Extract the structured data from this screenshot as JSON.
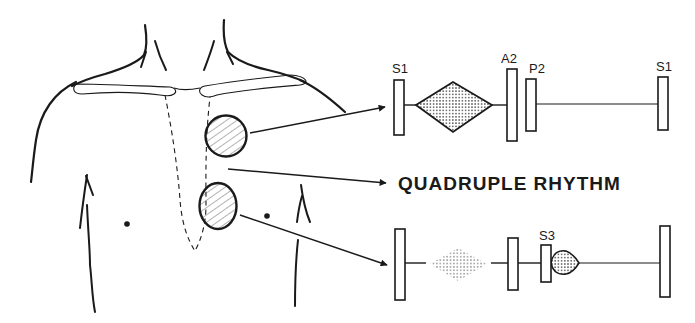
{
  "diagram": {
    "title": "QUADRUPLE RHYTHM",
    "colors": {
      "ink": "#1a1a1a",
      "background": "#ffffff",
      "hatch": "#555555",
      "stipple": "#333333"
    },
    "torso": {
      "auscultation_sites": [
        {
          "name": "upper-left-sternal-border",
          "pattern": "hatched"
        },
        {
          "name": "lower-left-sternal-border",
          "pattern": "hatched"
        }
      ]
    },
    "top_trace": {
      "labels": {
        "s1_start": "S1",
        "a2": "A2",
        "p2": "P2",
        "s1_end": "S1"
      },
      "murmur": "diamond (crescendo-decrescendo), dense stipple"
    },
    "bottom_trace": {
      "labels": {
        "s3": "S3"
      },
      "murmur": "faint diamond stipple; small lens-shaped early diastolic murmur after S3"
    }
  }
}
